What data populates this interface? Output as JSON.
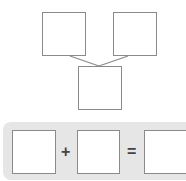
{
  "tree": {
    "boxes": [
      {
        "id": "top-left",
        "value": ""
      },
      {
        "id": "top-right",
        "value": ""
      },
      {
        "id": "bottom",
        "value": ""
      }
    ]
  },
  "equation": {
    "operand1": "",
    "operator1": "+",
    "operand2": "",
    "operator2": "=",
    "result": ""
  },
  "colors": {
    "box_border": "#8a8a8a",
    "panel_bg": "#e6e6e6",
    "line": "#8a8a8a"
  }
}
